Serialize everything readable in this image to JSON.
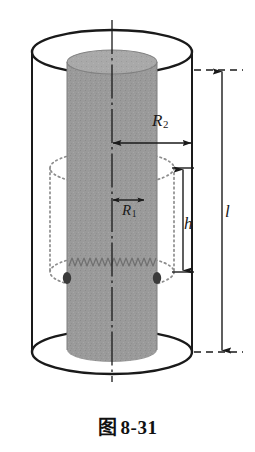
{
  "figure": {
    "caption_prefix": "图",
    "caption_number": "8-31",
    "caption_full": "图 8-31",
    "colors": {
      "outline": "#1a1a1a",
      "inner_cylinder_fill": "#9a9a9a",
      "inner_cylinder_top_fill": "#a8a8a8",
      "dotted_guide": "#8d8d8d",
      "background": "#ffffff"
    },
    "labels": {
      "r2": {
        "base": "R",
        "sub": "2",
        "text": "R₂",
        "meaning": "outer-radius"
      },
      "r1": {
        "base": "R",
        "sub": "1",
        "text": "R₁",
        "meaning": "inner-radius"
      },
      "h": {
        "base": "h",
        "sub": "",
        "text": "h",
        "meaning": "coil-height"
      },
      "l": {
        "base": "l",
        "sub": "",
        "text": "l",
        "meaning": "cylinder-length"
      }
    },
    "geometry": {
      "outer_cylinder": {
        "center_x": 112,
        "rx": 80,
        "ry": 22,
        "top_y": 52,
        "bottom_y": 352
      },
      "inner_cylinder": {
        "center_x": 112,
        "rx": 45,
        "ry": 12,
        "top_y": 62,
        "bottom_y": 350
      },
      "coil_region": {
        "center_x": 112,
        "rx": 62,
        "ry": 17,
        "top_y": 168,
        "bottom_y": 272
      },
      "axis_x": 112,
      "dimension_r2": {
        "y": 143,
        "x_start": 112,
        "x_end": 192
      },
      "dimension_r1": {
        "y": 200,
        "x_start": 112,
        "x_end": 145
      },
      "dimension_h": {
        "x": 183,
        "y_start": 168,
        "y_end": 272
      },
      "dimension_l": {
        "x": 222,
        "y_start": 70,
        "y_end": 352
      }
    }
  }
}
